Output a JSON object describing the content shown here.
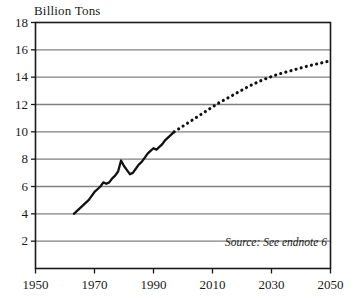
{
  "chart_data": {
    "type": "line",
    "title": "",
    "ylabel": "Billion Tons",
    "xlabel": "",
    "xlim": [
      1950,
      2050
    ],
    "ylim": [
      0,
      18
    ],
    "grid": true,
    "legend": "none",
    "source_note": "Source: See endnote 6",
    "y_ticks": [
      18,
      16,
      14,
      12,
      10,
      8,
      6,
      4,
      2
    ],
    "x_ticks": [
      1950,
      1970,
      1990,
      2010,
      2030,
      2050
    ],
    "series": [
      {
        "name": "Historical",
        "style": "solid",
        "x": [
          1963,
          1964,
          1965,
          1966,
          1967,
          1968,
          1969,
          1970,
          1971,
          1972,
          1973,
          1974,
          1975,
          1976,
          1977,
          1978,
          1979,
          1980,
          1981,
          1982,
          1983,
          1984,
          1985,
          1986,
          1987,
          1988,
          1989,
          1990,
          1991,
          1992,
          1993,
          1994,
          1995,
          1996,
          1997
        ],
        "values": [
          4.0,
          4.2,
          4.4,
          4.6,
          4.8,
          5.0,
          5.3,
          5.6,
          5.8,
          6.0,
          6.3,
          6.2,
          6.3,
          6.6,
          6.8,
          7.1,
          7.9,
          7.5,
          7.2,
          6.9,
          7.0,
          7.3,
          7.6,
          7.8,
          8.1,
          8.4,
          8.6,
          8.8,
          8.7,
          8.9,
          9.1,
          9.4,
          9.6,
          9.8,
          10.0
        ]
      },
      {
        "name": "Projection",
        "style": "dotted",
        "x": [
          1997,
          2002,
          2007,
          2012,
          2017,
          2022,
          2027,
          2032,
          2037,
          2042,
          2047,
          2050
        ],
        "values": [
          10.0,
          10.7,
          11.4,
          12.1,
          12.7,
          13.3,
          13.8,
          14.2,
          14.5,
          14.8,
          15.05,
          15.2
        ]
      }
    ],
    "colors": {
      "line": "#111111",
      "grid": "#808080",
      "axis": "#1a1a1a",
      "background": "#ffffff"
    }
  },
  "axis_labels": {
    "y": [
      "18",
      "16",
      "14",
      "12",
      "10",
      "8",
      "6",
      "4",
      "2"
    ],
    "x": [
      "1950",
      "1970",
      "1990",
      "2010",
      "2030",
      "2050"
    ]
  }
}
